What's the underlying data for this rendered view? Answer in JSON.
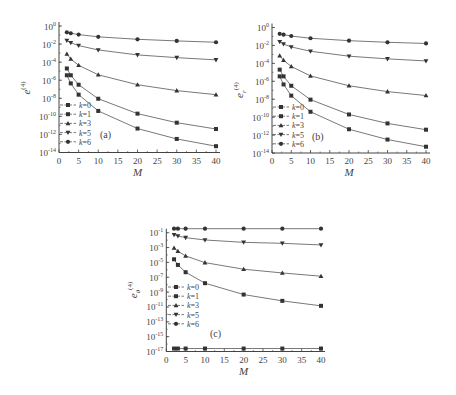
{
  "figure": {
    "panels": [
      "(a)",
      "(b)",
      "(c)"
    ]
  },
  "chart_data": [
    {
      "type": "line",
      "panel_label": "(a)",
      "title": "",
      "xlabel": "M",
      "ylabel": "e^(4)",
      "yscale": "log",
      "xlim": [
        0,
        40
      ],
      "ylim_exp": [
        -14,
        0
      ],
      "x_ticks": [
        0,
        5,
        10,
        15,
        20,
        25,
        30,
        35,
        40
      ],
      "y_tick_exponents": [
        0,
        -2,
        -4,
        -6,
        -8,
        -10,
        -12,
        -14
      ],
      "grid": false,
      "legend_position": "lower-left",
      "x": [
        2,
        3,
        5,
        10,
        20,
        30,
        40
      ],
      "series": [
        {
          "name": "k=0",
          "marker": "square",
          "log10_values": [
            -5.45,
            -6.35,
            -7.6,
            -9.4,
            -11.35,
            -12.5,
            -13.3
          ]
        },
        {
          "name": "k=1",
          "marker": "square",
          "log10_values": [
            -4.7,
            -5.45,
            -6.5,
            -8.05,
            -9.7,
            -10.7,
            -11.4
          ]
        },
        {
          "name": "k=3",
          "marker": "triangle-up",
          "log10_values": [
            -3.1,
            -3.65,
            -4.35,
            -5.4,
            -6.5,
            -7.15,
            -7.6
          ]
        },
        {
          "name": "k=5",
          "marker": "triangle-down",
          "log10_values": [
            -1.6,
            -1.85,
            -2.17,
            -2.65,
            -3.2,
            -3.5,
            -3.75
          ]
        },
        {
          "name": "k=6",
          "marker": "circle",
          "log10_values": [
            -0.7,
            -0.8,
            -0.95,
            -1.2,
            -1.47,
            -1.65,
            -1.8
          ]
        }
      ]
    },
    {
      "type": "line",
      "panel_label": "(b)",
      "title": "",
      "xlabel": "M",
      "ylabel": "e_r^(4)",
      "yscale": "log",
      "xlim": [
        0,
        40
      ],
      "ylim_exp": [
        -14,
        0
      ],
      "x_ticks": [
        0,
        5,
        10,
        15,
        20,
        25,
        30,
        35,
        40
      ],
      "y_tick_exponents": [
        0,
        -2,
        -4,
        -6,
        -8,
        -10,
        -12,
        -14
      ],
      "grid": false,
      "legend_position": "lower-left",
      "x": [
        2,
        3,
        5,
        10,
        20,
        30,
        40
      ],
      "series": [
        {
          "name": "k=0",
          "marker": "square",
          "log10_values": [
            -5.45,
            -6.35,
            -7.6,
            -9.4,
            -11.35,
            -12.5,
            -13.3
          ]
        },
        {
          "name": "k=1",
          "marker": "square",
          "log10_values": [
            -4.7,
            -5.45,
            -6.5,
            -8.05,
            -9.7,
            -10.7,
            -11.4
          ]
        },
        {
          "name": "k=3",
          "marker": "triangle-up",
          "log10_values": [
            -3.15,
            -3.65,
            -4.35,
            -5.4,
            -6.5,
            -7.15,
            -7.59
          ]
        },
        {
          "name": "k=5",
          "marker": "triangle-down",
          "log10_values": [
            -1.59,
            -1.85,
            -2.17,
            -2.65,
            -3.2,
            -3.5,
            -3.73
          ]
        },
        {
          "name": "k=6",
          "marker": "circle",
          "log10_values": [
            -0.7,
            -0.8,
            -0.95,
            -1.2,
            -1.47,
            -1.65,
            -1.78
          ]
        }
      ]
    },
    {
      "type": "line",
      "panel_label": "(c)",
      "title": "",
      "xlabel": "M",
      "ylabel": "e_θ^(4)",
      "yscale": "log",
      "xlim": [
        0,
        40
      ],
      "ylim_exp": [
        -17,
        -1
      ],
      "x_ticks": [
        0,
        5,
        10,
        15,
        20,
        25,
        30,
        35,
        40
      ],
      "y_tick_exponents": [
        -1,
        -3,
        -5,
        -7,
        -9,
        -11,
        -13,
        -15,
        -17
      ],
      "grid": false,
      "legend_position": "lower-left",
      "x": [
        2,
        3,
        5,
        10,
        20,
        30,
        40
      ],
      "series": [
        {
          "name": "k=0",
          "marker": "square",
          "log10_values": [
            -16.6,
            -16.6,
            -16.6,
            -16.6,
            -16.6,
            -16.6,
            -16.6
          ]
        },
        {
          "name": "k=1",
          "marker": "square",
          "log10_values": [
            -4.58,
            -5.34,
            -6.32,
            -7.8,
            -9.33,
            -10.18,
            -10.85
          ]
        },
        {
          "name": "k=3",
          "marker": "triangle-up",
          "log10_values": [
            -3.06,
            -3.5,
            -4.13,
            -5.03,
            -5.92,
            -6.42,
            -6.86
          ]
        },
        {
          "name": "k=5",
          "marker": "triangle-down",
          "log10_values": [
            -1.27,
            -1.44,
            -1.67,
            -1.98,
            -2.3,
            -2.43,
            -2.65
          ]
        },
        {
          "name": "k=6",
          "marker": "circle",
          "log10_values": [
            -0.46,
            -0.46,
            -0.46,
            -0.46,
            -0.46,
            -0.46,
            -0.46
          ]
        }
      ]
    }
  ]
}
